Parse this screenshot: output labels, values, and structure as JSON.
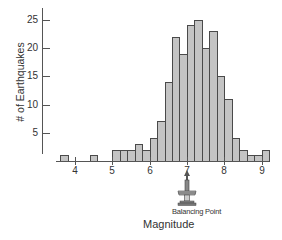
{
  "chart_data": {
    "type": "bar",
    "subtype": "histogram",
    "title": "",
    "xlabel": "Magnitude",
    "ylabel": "# of Earthquakes",
    "bin_width": 0.2,
    "bins": [
      {
        "start": 3.6,
        "end": 3.8,
        "count": 1
      },
      {
        "start": 4.4,
        "end": 4.6,
        "count": 1
      },
      {
        "start": 5.0,
        "end": 5.2,
        "count": 2
      },
      {
        "start": 5.2,
        "end": 5.4,
        "count": 2
      },
      {
        "start": 5.4,
        "end": 5.6,
        "count": 2
      },
      {
        "start": 5.6,
        "end": 5.8,
        "count": 3
      },
      {
        "start": 5.8,
        "end": 6.0,
        "count": 2
      },
      {
        "start": 6.0,
        "end": 6.2,
        "count": 4
      },
      {
        "start": 6.2,
        "end": 6.4,
        "count": 7
      },
      {
        "start": 6.4,
        "end": 6.6,
        "count": 14
      },
      {
        "start": 6.6,
        "end": 6.8,
        "count": 22
      },
      {
        "start": 6.8,
        "end": 7.0,
        "count": 19
      },
      {
        "start": 7.0,
        "end": 7.2,
        "count": 24
      },
      {
        "start": 7.2,
        "end": 7.4,
        "count": 25
      },
      {
        "start": 7.4,
        "end": 7.6,
        "count": 20
      },
      {
        "start": 7.6,
        "end": 7.8,
        "count": 23
      },
      {
        "start": 7.8,
        "end": 8.0,
        "count": 15
      },
      {
        "start": 8.0,
        "end": 8.2,
        "count": 11
      },
      {
        "start": 8.2,
        "end": 8.4,
        "count": 4
      },
      {
        "start": 8.4,
        "end": 8.6,
        "count": 2
      },
      {
        "start": 8.6,
        "end": 8.8,
        "count": 1
      },
      {
        "start": 8.8,
        "end": 9.0,
        "count": 1
      },
      {
        "start": 9.0,
        "end": 9.2,
        "count": 2
      }
    ],
    "x_ticks": [
      "4",
      "5",
      "6",
      "7",
      "8",
      "9"
    ],
    "y_ticks": [
      "5",
      "10",
      "15",
      "20",
      "25"
    ],
    "xlim": [
      3.55,
      9.2
    ],
    "ylim": [
      0,
      27
    ],
    "grid": false,
    "legend": null,
    "annotations": [
      {
        "text": "Balancing Point",
        "x": 7.0,
        "marker": "fulcrum-icon"
      }
    ],
    "colors": {
      "bar_fill": "#c4c4c4",
      "bar_edge": "#4a4a4a",
      "axis": "#555555"
    }
  },
  "labels": {
    "xlabel": "Magnitude",
    "ylabel": "# of Earthquakes",
    "balancing_point": "Balancing Point"
  }
}
